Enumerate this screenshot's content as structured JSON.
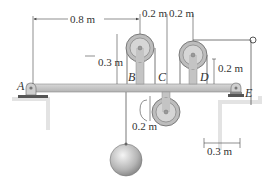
{
  "figure": {
    "type": "statics-frame-pulley-diagram",
    "points": {
      "A": "A",
      "B": "B",
      "C": "C",
      "D": "D",
      "E": "E"
    },
    "dimensions": {
      "a_to_b": "0.8 m",
      "b_to_c": "0.2 m",
      "c_to_d": "0.2 m",
      "pulley_b_height": "0.3 m",
      "pulley_d_height": "0.2 m",
      "lower_pulley_depth": "0.2 m",
      "e_to_cable": "0.3 m"
    },
    "colors": {
      "beam": "#c9c9c9",
      "beam_edge": "#8a8a8a",
      "pulley": "#bdbdbd",
      "ground": "#dcdcdc",
      "line": "#444444"
    }
  }
}
